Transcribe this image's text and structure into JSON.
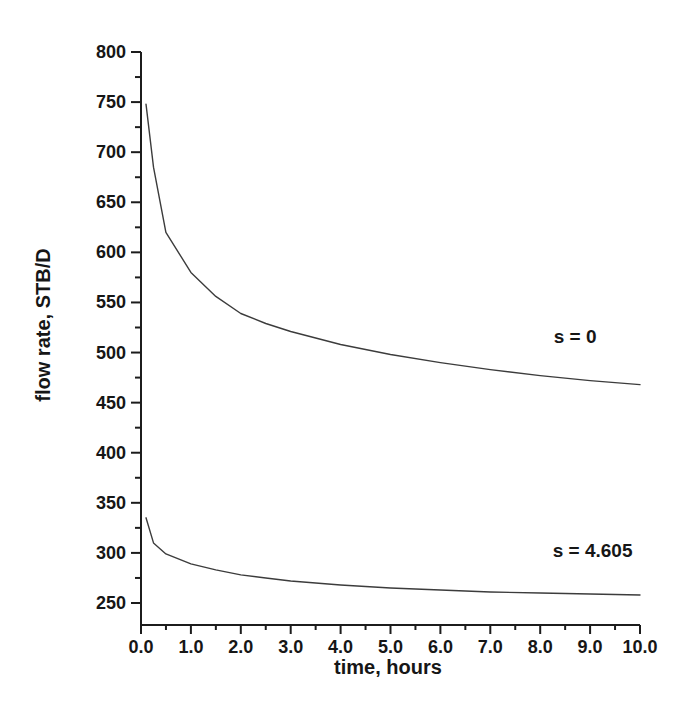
{
  "page": {
    "background_color": "#ffffff"
  },
  "chart_data": {
    "type": "line",
    "title": "",
    "xlabel": "time, hours",
    "ylabel": "flow rate, STB/D",
    "xlim": [
      0,
      10
    ],
    "ylim": [
      250,
      800
    ],
    "grid": false,
    "legend_position": "inline-annotations",
    "axis_color": "#1c1c1c",
    "curve_color": "#3c3c3c",
    "x_major_ticks": [
      0,
      1,
      2,
      3,
      4,
      5,
      6,
      7,
      8,
      9,
      10
    ],
    "x_tick_labels": [
      "0.0",
      "1.0",
      "2.0",
      "3.0",
      "4.0",
      "5.0",
      "6.0",
      "7.0",
      "8.0",
      "9.0",
      "10.0"
    ],
    "x_minor_tick_step": 0.5,
    "y_major_ticks": [
      250,
      300,
      350,
      400,
      450,
      500,
      550,
      600,
      650,
      700,
      750,
      800
    ],
    "y_tick_labels": [
      "250",
      "300",
      "350",
      "400",
      "450",
      "500",
      "550",
      "600",
      "650",
      "700",
      "750",
      "800"
    ],
    "y_minor_tick_step": 25,
    "series": [
      {
        "name": "s = 0",
        "x": [
          0.1,
          0.25,
          0.5,
          1,
          1.5,
          2,
          2.5,
          3,
          4,
          5,
          6,
          7,
          8,
          9,
          10
        ],
        "y": [
          748,
          685,
          620,
          580,
          556,
          539,
          529,
          521,
          508,
          498,
          490,
          483,
          477,
          472,
          468
        ]
      },
      {
        "name": "s = 4.605",
        "x": [
          0.1,
          0.25,
          0.5,
          1,
          1.5,
          2,
          2.5,
          3,
          4,
          5,
          6,
          7,
          8,
          9,
          10
        ],
        "y": [
          335,
          310,
          299,
          289,
          283,
          278,
          275,
          272,
          268,
          265,
          263,
          261,
          260,
          259,
          258
        ]
      }
    ],
    "annotations": [
      {
        "text": "s = 0",
        "x": 8.7,
        "y": 517
      },
      {
        "text": "s = 4.605",
        "x": 9.05,
        "y": 303
      }
    ]
  }
}
